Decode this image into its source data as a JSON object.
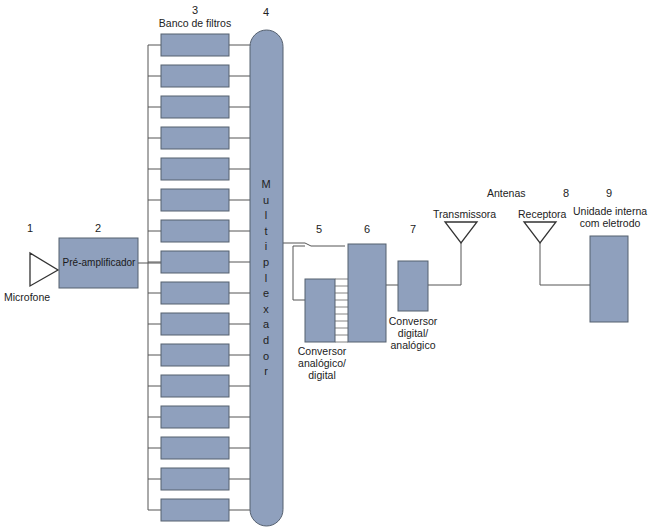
{
  "diagram": {
    "title": "",
    "colors": {
      "block_fill": "#8fa0bd",
      "block_stroke": "#55606f",
      "line": "#555555",
      "background": "#ffffff"
    },
    "components": [
      {
        "id": "1",
        "number": "1",
        "label": "Microfone",
        "shape": "triangle-antenna"
      },
      {
        "id": "2",
        "number": "2",
        "label": "Pré-amplificador",
        "shape": "rect"
      },
      {
        "id": "3",
        "number": "3",
        "label": "Banco de filtros",
        "shape": "rect-stack",
        "count": 16
      },
      {
        "id": "4",
        "number": "4",
        "label": "Multiplexador",
        "shape": "capsule"
      },
      {
        "id": "5",
        "number": "5",
        "label": "Conversor analógico/ digital",
        "shape": "rect"
      },
      {
        "id": "6",
        "number": "6",
        "label": "",
        "shape": "rect"
      },
      {
        "id": "7",
        "number": "7",
        "label": "Conversor digital/ analógico",
        "shape": "rect"
      },
      {
        "id": "ant",
        "number": "",
        "label": "Antenas",
        "shape": "group-label"
      },
      {
        "id": "tx",
        "number": "",
        "label": "Transmissora",
        "shape": "triangle-antenna"
      },
      {
        "id": "8",
        "number": "8",
        "label": "Receptora",
        "shape": "triangle-antenna"
      },
      {
        "id": "9",
        "number": "9",
        "label": "Unidade interna com eletrodo",
        "shape": "rect"
      }
    ],
    "edges": [
      [
        "1",
        "2"
      ],
      [
        "2",
        "3"
      ],
      [
        "3",
        "4"
      ],
      [
        "4",
        "5"
      ],
      [
        "5",
        "6"
      ],
      [
        "6",
        "7"
      ],
      [
        "7",
        "tx"
      ],
      [
        "tx",
        "8"
      ],
      [
        "8",
        "9"
      ]
    ]
  },
  "labels": {
    "n1": "1",
    "n2": "2",
    "n3": "3",
    "n4": "4",
    "n5": "5",
    "n6": "6",
    "n7": "7",
    "n8": "8",
    "n9": "9",
    "microfone": "Microfone",
    "preamp": "Pré-amplificador",
    "banco": "Banco de filtros",
    "mux_letters": [
      "M",
      "u",
      "l",
      "t",
      "i",
      "p",
      "l",
      "e",
      "x",
      "a",
      "d",
      "o",
      "r"
    ],
    "adc_line1": "Conversor",
    "adc_line2": "analógico/",
    "adc_line3": "digital",
    "dac_line1": "Conversor",
    "dac_line2": "digital/",
    "dac_line3": "analógico",
    "antenas": "Antenas",
    "transmissora": "Transmissora",
    "receptora": "Receptora",
    "unidade_line1": "Unidade interna",
    "unidade_line2": "com eletrodo"
  }
}
